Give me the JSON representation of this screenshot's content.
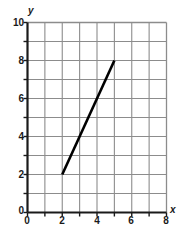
{
  "chart_data": {
    "type": "line",
    "title": "",
    "xlabel": "x",
    "ylabel": "y",
    "xlim": [
      0,
      8
    ],
    "ylim": [
      0,
      10
    ],
    "grid": true,
    "legend": null,
    "x_tick_labels": [
      "0",
      "2",
      "4",
      "6",
      "8"
    ],
    "x_tick_values": [
      0,
      2,
      4,
      6,
      8
    ],
    "y_tick_labels": [
      "0",
      "2",
      "4",
      "6",
      "8",
      "10"
    ],
    "y_tick_values": [
      0,
      2,
      4,
      6,
      8,
      10
    ],
    "x_minor_step": 1,
    "y_minor_step": 1,
    "series": [
      {
        "name": "segment",
        "type": "line",
        "x": [
          2,
          5
        ],
        "y": [
          2,
          8
        ],
        "color": "#000000"
      }
    ],
    "colors": {
      "axis": "#1a1a1a",
      "grid": "#8c8c8c",
      "line": "#000000",
      "background": "#ffffff"
    }
  }
}
